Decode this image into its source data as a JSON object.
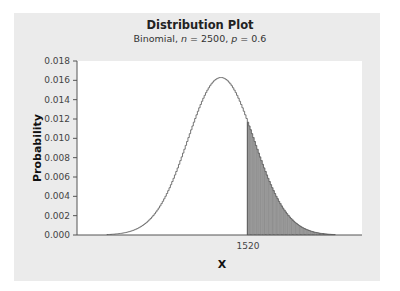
{
  "chart_data": {
    "type": "bar",
    "title": "Distribution Plot",
    "subtitle": {
      "prefix": "Binomial, ",
      "n_symbol": "n",
      "n_value": "2500",
      "p_symbol": "p",
      "p_value": "0.6"
    },
    "distribution": {
      "name": "Binomial",
      "n": 2500,
      "p": 0.6,
      "mean": 1500,
      "sd": 24.49
    },
    "xlabel": "X",
    "ylabel": "Probability",
    "ylim": [
      0,
      0.018
    ],
    "yticks": [
      "0.000",
      "0.002",
      "0.004",
      "0.006",
      "0.008",
      "0.010",
      "0.012",
      "0.014",
      "0.016",
      "0.018"
    ],
    "xticks": [
      "1520"
    ],
    "x_range_plotted": [
      1416,
      1584
    ],
    "shaded_region": {
      "from": 1520,
      "to": 1584,
      "label": "P(X >= 1520)"
    },
    "peak": {
      "x": 1500,
      "y": 0.0163
    },
    "value_at_1520": 0.0117,
    "grid": false,
    "colors": {
      "curve": "#666666",
      "fill": "#9a9a9a",
      "panel": "#ebebeb",
      "plot_bg": "#ffffff",
      "axis": "#555555"
    }
  }
}
